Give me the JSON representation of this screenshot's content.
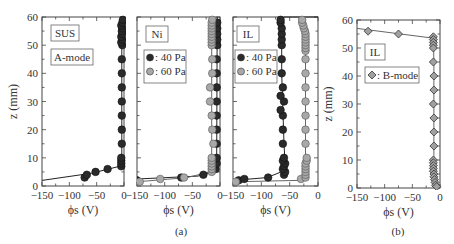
{
  "chart_data": [
    {
      "type": "scatter",
      "id": "sus",
      "panel_label": "SUS",
      "mode_label": "A-mode",
      "group": "(a)",
      "xlabel": "ϕs (V)",
      "ylabel": "z (mm)",
      "xlim": [
        -150,
        0
      ],
      "ylim": [
        0,
        60
      ],
      "xticks": [
        -150,
        -100,
        -50,
        0
      ],
      "yticks": [
        0,
        10,
        20,
        30,
        40,
        50,
        60
      ],
      "series": [
        {
          "name": "SUS A-mode",
          "marker": "circle",
          "color": "#2a2a2a",
          "points": [
            [
              -72,
              3
            ],
            [
              -68,
              4
            ],
            [
              -52,
              5
            ],
            [
              -30,
              6
            ],
            [
              -5,
              7
            ],
            [
              -5,
              8
            ],
            [
              -5,
              9
            ],
            [
              -5,
              10
            ],
            [
              -4,
              15
            ],
            [
              -4,
              20
            ],
            [
              -4,
              25
            ],
            [
              -4,
              30
            ],
            [
              -4,
              35
            ],
            [
              -4,
              40
            ],
            [
              -4,
              45
            ],
            [
              -3,
              50
            ],
            [
              -5,
              51
            ],
            [
              -3,
              52
            ],
            [
              -5,
              53
            ],
            [
              -3,
              54
            ],
            [
              -4,
              55
            ],
            [
              -3,
              56
            ],
            [
              -5,
              57
            ],
            [
              -3,
              58
            ],
            [
              -2,
              59
            ]
          ],
          "fit": [
            [
              -150,
              2
            ],
            [
              -60,
              4.5
            ],
            [
              -8,
              7
            ],
            [
              -4,
              10
            ],
            [
              -4,
              60
            ]
          ]
        }
      ]
    },
    {
      "type": "scatter",
      "id": "ni",
      "panel_label": "Ni",
      "group": "(a)",
      "xlabel": "ϕs (V)",
      "xlim": [
        -150,
        0
      ],
      "ylim": [
        0,
        60
      ],
      "xticks": [
        -150,
        -100,
        -50,
        0
      ],
      "legend": [
        {
          "label": ": 40 Pa",
          "color": "#2a2a2a"
        },
        {
          "label": ": 60 Pa",
          "color": "#a8a8a8"
        }
      ],
      "series": [
        {
          "name": "40 Pa",
          "marker": "circle",
          "color": "#2a2a2a",
          "points": [
            [
              -150,
              2
            ],
            [
              -70,
              3
            ],
            [
              -30,
              4
            ],
            [
              -8,
              6
            ],
            [
              -6,
              8
            ],
            [
              -6,
              10
            ],
            [
              -6,
              15
            ],
            [
              -6,
              20
            ],
            [
              -6,
              25
            ],
            [
              -6,
              30
            ],
            [
              -6,
              35
            ],
            [
              -6,
              40
            ],
            [
              -6,
              45
            ],
            [
              -5,
              50
            ],
            [
              -5,
              52
            ],
            [
              -5,
              54
            ],
            [
              -5,
              56
            ],
            [
              -5,
              58
            ]
          ],
          "fit": [
            [
              -150,
              2.5
            ],
            [
              -40,
              3.5
            ],
            [
              -10,
              5
            ],
            [
              -6,
              10
            ],
            [
              -5,
              60
            ]
          ]
        },
        {
          "name": "60 Pa",
          "marker": "circle",
          "color": "#a8a8a8",
          "points": [
            [
              -145,
              1.5
            ],
            [
              -108,
              2.5
            ],
            [
              -65,
              3
            ],
            [
              -15,
              5
            ],
            [
              -15,
              6
            ],
            [
              -15,
              7
            ],
            [
              -15,
              8
            ],
            [
              -15,
              9
            ],
            [
              -15,
              10
            ],
            [
              -12,
              15
            ],
            [
              -14,
              20
            ],
            [
              -15,
              25
            ],
            [
              -18,
              30
            ],
            [
              -18,
              35
            ],
            [
              -14,
              40
            ],
            [
              -14,
              45
            ],
            [
              -15,
              50
            ],
            [
              -15,
              51
            ],
            [
              -15,
              52
            ],
            [
              -15,
              53
            ],
            [
              -15,
              54
            ],
            [
              -15,
              55
            ],
            [
              -15,
              56
            ],
            [
              -15,
              57
            ],
            [
              -15,
              58
            ],
            [
              -14,
              59
            ]
          ],
          "fit": [
            [
              -150,
              1.5
            ],
            [
              -60,
              3
            ],
            [
              -18,
              5
            ],
            [
              -15,
              10
            ],
            [
              -15,
              60
            ]
          ]
        }
      ]
    },
    {
      "type": "scatter",
      "id": "il",
      "panel_label": "IL",
      "group": "(a)",
      "xlabel": "ϕs (V)",
      "xlim": [
        -150,
        0
      ],
      "ylim": [
        0,
        60
      ],
      "xticks": [
        -150,
        -100,
        -50,
        0
      ],
      "legend": [
        {
          "label": ": 40 Pa",
          "color": "#2a2a2a"
        },
        {
          "label": ": 60 Pa",
          "color": "#a8a8a8"
        }
      ],
      "series": [
        {
          "name": "40 Pa",
          "marker": "circle",
          "color": "#2a2a2a",
          "points": [
            [
              -140,
              2
            ],
            [
              -130,
              2.5
            ],
            [
              -88,
              3
            ],
            [
              -60,
              4
            ],
            [
              -58,
              5
            ],
            [
              -62,
              6
            ],
            [
              -60,
              7
            ],
            [
              -58,
              8
            ],
            [
              -62,
              9
            ],
            [
              -60,
              10
            ],
            [
              -62,
              15
            ],
            [
              -62,
              20
            ],
            [
              -62,
              25
            ],
            [
              -66,
              27
            ],
            [
              -60,
              30
            ],
            [
              -66,
              32
            ],
            [
              -62,
              35
            ],
            [
              -64,
              40
            ],
            [
              -64,
              45
            ],
            [
              -64,
              50
            ],
            [
              -64,
              52
            ],
            [
              -64,
              54
            ],
            [
              -64,
              56
            ],
            [
              -66,
              58
            ],
            [
              -66,
              59
            ]
          ],
          "fit": [
            [
              -150,
              2
            ],
            [
              -90,
              3
            ],
            [
              -65,
              5
            ],
            [
              -58,
              8
            ],
            [
              -60,
              15
            ],
            [
              -64,
              40
            ],
            [
              -64,
              58
            ],
            [
              -60,
              60
            ],
            [
              0,
              60
            ]
          ]
        },
        {
          "name": "60 Pa",
          "marker": "circle",
          "color": "#a8a8a8",
          "points": [
            [
              -145,
              1.5
            ],
            [
              -30,
              2.5
            ],
            [
              -22,
              3
            ],
            [
              -22,
              4
            ],
            [
              -22,
              5
            ],
            [
              -22,
              6
            ],
            [
              -22,
              7
            ],
            [
              -22,
              8
            ],
            [
              -20,
              9
            ],
            [
              -20,
              10
            ],
            [
              -22,
              15
            ],
            [
              -22,
              20
            ],
            [
              -22,
              25
            ],
            [
              -22,
              30
            ],
            [
              -22,
              35
            ],
            [
              -22,
              40
            ],
            [
              -22,
              45
            ],
            [
              -22,
              48
            ],
            [
              -22,
              49
            ],
            [
              -22,
              50
            ],
            [
              -22,
              51
            ],
            [
              -22,
              52
            ],
            [
              -22,
              53
            ],
            [
              -22,
              54
            ],
            [
              -23,
              55
            ],
            [
              -25,
              56
            ],
            [
              -26,
              57
            ],
            [
              -28,
              58
            ],
            [
              -28,
              59
            ]
          ],
          "fit": [
            [
              -150,
              1.5
            ],
            [
              -35,
              2
            ],
            [
              -25,
              3
            ],
            [
              -22,
              10
            ],
            [
              -22,
              50
            ],
            [
              -26,
              57
            ],
            [
              -35,
              60
            ]
          ]
        }
      ]
    },
    {
      "type": "scatter",
      "id": "il-b",
      "panel_label": "IL",
      "group": "(b)",
      "xlabel": "ϕs (V)",
      "ylabel": "z (mm)",
      "xlim": [
        -150,
        0
      ],
      "ylim": [
        0,
        60
      ],
      "xticks": [
        -150,
        -100,
        -50,
        0
      ],
      "yticks": [
        0,
        10,
        20,
        30,
        40,
        50,
        60
      ],
      "legend": [
        {
          "label": ": B-mode",
          "color": "#a0a0a0",
          "marker": "diamond"
        }
      ],
      "series": [
        {
          "name": "B-mode",
          "marker": "diamond",
          "color": "#a0a0a0",
          "points": [
            [
              -130,
              56
            ],
            [
              -75,
              55
            ],
            [
              -12,
              54
            ],
            [
              -12,
              53
            ],
            [
              -12,
              52
            ],
            [
              -12,
              51
            ],
            [
              -12,
              50
            ],
            [
              -12,
              45
            ],
            [
              -11,
              40
            ],
            [
              -11,
              35
            ],
            [
              -12,
              30
            ],
            [
              -11,
              25
            ],
            [
              -11,
              20
            ],
            [
              -11,
              15
            ],
            [
              -12,
              10
            ],
            [
              -12,
              9
            ],
            [
              -12,
              8
            ],
            [
              -12,
              7
            ],
            [
              -12,
              6
            ],
            [
              -11,
              5
            ],
            [
              -11,
              4
            ],
            [
              -10,
              3
            ],
            [
              -9,
              2
            ],
            [
              -8,
              1
            ],
            [
              -6,
              0.5
            ]
          ],
          "fit": [
            [
              -150,
              57
            ],
            [
              -12,
              53.5
            ],
            [
              -11,
              45
            ],
            [
              -11,
              10
            ],
            [
              -6,
              0
            ]
          ]
        }
      ]
    }
  ],
  "captions": {
    "a": "(a)",
    "b": "(b)"
  },
  "axis_titles": {
    "x": "ϕs (V)",
    "y": "z (mm)"
  }
}
